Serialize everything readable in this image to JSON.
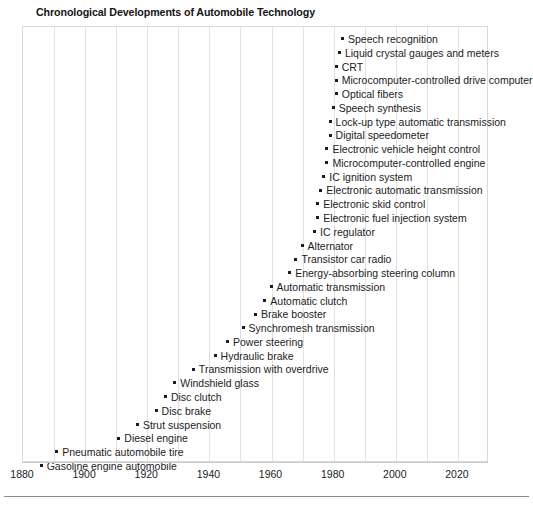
{
  "chart_data": {
    "type": "scatter",
    "title": "Chronological Developments of Automobile Technology",
    "xlabel": "",
    "ylabel": "",
    "xlim": [
      1880,
      2030
    ],
    "grid": true,
    "gridline_interval": 10,
    "legend_position": "none",
    "x_ticks": [
      1880,
      1900,
      1920,
      1940,
      1960,
      1980,
      2000,
      2020
    ],
    "x_tick_labels": [
      "1880",
      "1900",
      "1920",
      "1940",
      "1960",
      "1980",
      "2000",
      "2020"
    ],
    "point_marker": "square",
    "series": [
      {
        "name": "Automobile technology milestones",
        "points": [
          {
            "label": "Speech recognition",
            "year": 1983
          },
          {
            "label": "Liquid crystal gauges and meters",
            "year": 1982
          },
          {
            "label": "CRT",
            "year": 1981
          },
          {
            "label": "Microcomputer-controlled drive computer",
            "year": 1981
          },
          {
            "label": "Optical fibers",
            "year": 1981
          },
          {
            "label": "Speech synthesis",
            "year": 1980
          },
          {
            "label": "Lock-up type automatic transmission",
            "year": 1979
          },
          {
            "label": "Digital speedometer",
            "year": 1979
          },
          {
            "label": "Electronic vehicle height control",
            "year": 1978
          },
          {
            "label": "Microcomputer-controlled engine",
            "year": 1978
          },
          {
            "label": "IC ignition system",
            "year": 1977
          },
          {
            "label": "Electronic automatic transmission",
            "year": 1976
          },
          {
            "label": "Electronic skid control",
            "year": 1975
          },
          {
            "label": "Electronic fuel injection system",
            "year": 1975
          },
          {
            "label": "IC regulator",
            "year": 1974
          },
          {
            "label": "Alternator",
            "year": 1970
          },
          {
            "label": "Transistor car radio",
            "year": 1968
          },
          {
            "label": "Energy-absorbing steering column",
            "year": 1966
          },
          {
            "label": "Automatic transmission",
            "year": 1960
          },
          {
            "label": "Automatic clutch",
            "year": 1958
          },
          {
            "label": "Brake booster",
            "year": 1955
          },
          {
            "label": "Synchromesh transmission",
            "year": 1951
          },
          {
            "label": "Power steering",
            "year": 1946
          },
          {
            "label": "Hydraulic brake",
            "year": 1942
          },
          {
            "label": "Transmission with overdrive",
            "year": 1935
          },
          {
            "label": "Windshield glass",
            "year": 1929
          },
          {
            "label": "Disc clutch",
            "year": 1926
          },
          {
            "label": "Disc brake",
            "year": 1923
          },
          {
            "label": "Strut suspension",
            "year": 1917
          },
          {
            "label": "Diesel engine",
            "year": 1911
          },
          {
            "label": "Pneumatic automobile tire",
            "year": 1891
          },
          {
            "label": "Gasoline engine automobile",
            "year": 1886
          }
        ]
      }
    ]
  },
  "figure": {
    "title": "Chronological Developments of Automobile Technology",
    "axis": {
      "tick_labels": [
        "1880",
        "1900",
        "1920",
        "1940",
        "1960",
        "1980",
        "2000",
        "2020"
      ]
    }
  },
  "style": {
    "text_color": "#1c1c1c",
    "gridline_color": "#e2e2e2",
    "plot_border_color": "#d9d9d9",
    "axis_color": "#c8c8c8",
    "footer_rule_color": "#8c8c8c",
    "marker_color": "#1c1c1c"
  }
}
